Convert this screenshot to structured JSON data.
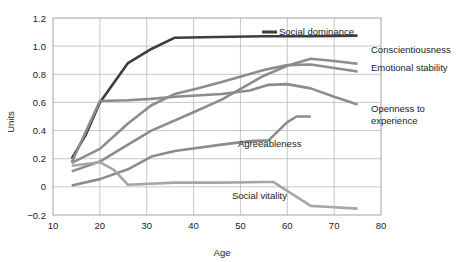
{
  "chart_data": {
    "type": "line",
    "title": "",
    "xlabel": "Age",
    "ylabel": "Units",
    "xlim": [
      10,
      80
    ],
    "ylim": [
      -0.2,
      1.2
    ],
    "xticks": [
      "10",
      "20",
      "30",
      "40",
      "50",
      "60",
      "70",
      "80"
    ],
    "yticks": [
      "1.2",
      "1.0",
      "0.8",
      "0.6",
      "0.4",
      "0.2",
      "0",
      "-0.2"
    ],
    "grid": true,
    "legend_position": "inline-right",
    "series": [
      {
        "name": "Social dominance",
        "color": "#3d3d3d",
        "width": 2.6,
        "label_x": 279,
        "label_y": 35,
        "label_anchor": "start",
        "points": [
          [
            14,
            0.2
          ],
          [
            17,
            0.37
          ],
          [
            20,
            0.6
          ],
          [
            26,
            0.88
          ],
          [
            31,
            0.98
          ],
          [
            36,
            1.06
          ],
          [
            45,
            1.065
          ],
          [
            55,
            1.07
          ],
          [
            65,
            1.07
          ],
          [
            75,
            1.075
          ]
        ]
      },
      {
        "name": "Conscientiousness",
        "color": "#8c8c8c",
        "width": 2.6,
        "label_x": 371,
        "label_y": 53,
        "label_anchor": "start",
        "points": [
          [
            14,
            0.11
          ],
          [
            20,
            0.18
          ],
          [
            26,
            0.3
          ],
          [
            31,
            0.4
          ],
          [
            40,
            0.53
          ],
          [
            46,
            0.62
          ],
          [
            55,
            0.79
          ],
          [
            60,
            0.86
          ],
          [
            65,
            0.91
          ],
          [
            70,
            0.895
          ],
          [
            75,
            0.875
          ]
        ]
      },
      {
        "name": "Emotional stability",
        "color": "#8c8c8c",
        "width": 2.6,
        "label_x": 371,
        "label_y": 71,
        "label_anchor": "start",
        "points": [
          [
            14,
            0.17
          ],
          [
            20,
            0.27
          ],
          [
            26,
            0.45
          ],
          [
            31,
            0.58
          ],
          [
            36,
            0.66
          ],
          [
            41,
            0.7
          ],
          [
            46,
            0.745
          ],
          [
            55,
            0.83
          ],
          [
            60,
            0.865
          ],
          [
            65,
            0.87
          ],
          [
            70,
            0.845
          ],
          [
            75,
            0.82
          ]
        ]
      },
      {
        "name": "Openness to experience",
        "color": "#8c8c8c",
        "width": 2.6,
        "label_x": 371,
        "label_y": 112,
        "label_anchor": "start",
        "label_line2_y": 124,
        "points": [
          [
            14,
            0.175
          ],
          [
            20,
            0.61
          ],
          [
            26,
            0.615
          ],
          [
            31,
            0.625
          ],
          [
            36,
            0.64
          ],
          [
            46,
            0.66
          ],
          [
            52,
            0.685
          ],
          [
            56,
            0.725
          ],
          [
            60,
            0.73
          ],
          [
            65,
            0.7
          ],
          [
            70,
            0.64
          ],
          [
            75,
            0.585
          ]
        ]
      },
      {
        "name": "Agreeableness",
        "color": "#8c8c8c",
        "width": 2.6,
        "label_x": 238,
        "label_y": 147,
        "label_anchor": "start",
        "points": [
          [
            14,
            0.01
          ],
          [
            20,
            0.055
          ],
          [
            26,
            0.125
          ],
          [
            31,
            0.215
          ],
          [
            36,
            0.255
          ],
          [
            46,
            0.3
          ],
          [
            52,
            0.325
          ],
          [
            56,
            0.33
          ],
          [
            60,
            0.46
          ],
          [
            62,
            0.5
          ],
          [
            65,
            0.5
          ]
        ]
      },
      {
        "name": "Social vitality",
        "color": "#a6a6a6",
        "width": 2.6,
        "label_x": 232,
        "label_y": 199,
        "label_anchor": "start",
        "points": [
          [
            14,
            0.15
          ],
          [
            20,
            0.175
          ],
          [
            23,
            0.12
          ],
          [
            26,
            0.015
          ],
          [
            36,
            0.03
          ],
          [
            46,
            0.03
          ],
          [
            55,
            0.035
          ],
          [
            57,
            0.035
          ],
          [
            65,
            -0.135
          ],
          [
            70,
            -0.145
          ],
          [
            75,
            -0.155
          ]
        ]
      }
    ],
    "legend_swatch": {
      "social_dominance": {
        "x1": 262,
        "x2": 277,
        "y": 32,
        "color": "#3d3d3d"
      }
    }
  }
}
